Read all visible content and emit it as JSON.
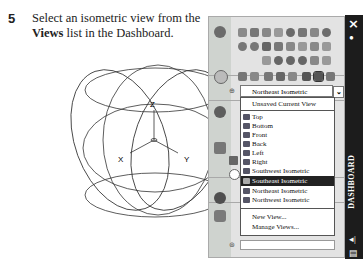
{
  "instruction": {
    "step_number": "5",
    "text_before": "Select an isometric view from the ",
    "bold_word": "Views",
    "text_after": " list in the Dashboard."
  },
  "drawing": {
    "axis_labels": {
      "z": "Z",
      "x": "X",
      "y": "Y"
    }
  },
  "dashboard": {
    "title": "DASHBOARD",
    "close_icon": "×",
    "views_dropdown": {
      "selected": "Northeast Isometric",
      "arrow": "⌄"
    },
    "views_list": {
      "header_item": "Unsaved Current View",
      "items": [
        {
          "label": "Top",
          "icon": "top-view-icon"
        },
        {
          "label": "Bottom",
          "icon": "bottom-view-icon"
        },
        {
          "label": "Front",
          "icon": "front-view-icon"
        },
        {
          "label": "Back",
          "icon": "back-view-icon"
        },
        {
          "label": "Left",
          "icon": "left-view-icon"
        },
        {
          "label": "Right",
          "icon": "right-view-icon"
        },
        {
          "label": "Southwest Isometric",
          "icon": "sw-iso-icon"
        },
        {
          "label": "Southeast Isometric",
          "icon": "se-iso-icon",
          "highlighted": true
        },
        {
          "label": "Northeast Isometric",
          "icon": "ne-iso-icon"
        },
        {
          "label": "Northwest Isometric",
          "icon": "nw-iso-icon"
        }
      ],
      "actions": [
        "New View...",
        "Manage Views..."
      ]
    }
  }
}
